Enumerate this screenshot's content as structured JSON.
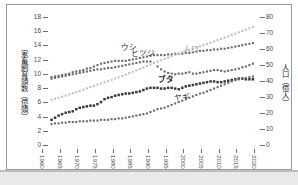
{
  "axes": {
    "left_title": "家畜飼育頭数（億頭）",
    "right_title": "人口（億人）",
    "left_ticks": [
      "0",
      "2",
      "4",
      "6",
      "8",
      "10",
      "12",
      "14",
      "16",
      "18"
    ],
    "right_ticks": [
      "0",
      "10",
      "20",
      "30",
      "40",
      "50",
      "60",
      "70",
      "80"
    ],
    "x_ticks": [
      "1960",
      "1965",
      "1970",
      "1975",
      "1980",
      "1985",
      "1990",
      "1995",
      "2000",
      "2005",
      "2010",
      "2015",
      "2020"
    ]
  },
  "labels": {
    "ushi": "ウシ",
    "hitsuji": "ヒツジ",
    "buta": "ブタ",
    "yagi": "ヤギ",
    "jinko": "人口"
  },
  "chart_data": {
    "type": "line",
    "title": "",
    "xlabel": "",
    "ylabel": "家畜飼育頭数（億頭）",
    "y2label": "人口（億人）",
    "xlim": [
      1960,
      2020
    ],
    "ylim": [
      0,
      18
    ],
    "y2lim": [
      0,
      80
    ],
    "grid": false,
    "legend": "inline-annotations",
    "x": [
      1961,
      1962,
      1963,
      1964,
      1965,
      1966,
      1967,
      1968,
      1969,
      1970,
      1971,
      1972,
      1973,
      1974,
      1975,
      1976,
      1977,
      1978,
      1979,
      1980,
      1981,
      1982,
      1983,
      1984,
      1985,
      1986,
      1987,
      1988,
      1989,
      1990,
      1991,
      1992,
      1993,
      1994,
      1995,
      1996,
      1997,
      1998,
      1999,
      2000,
      2001,
      2002,
      2003,
      2004,
      2005,
      2006,
      2007,
      2008,
      2009,
      2010,
      2011,
      2012,
      2013,
      2014,
      2015,
      2016,
      2017,
      2018
    ],
    "series": [
      {
        "name": "ウシ",
        "axis": "left",
        "color": "#6b6b6b",
        "values": [
          10.1,
          10.2,
          10.3,
          10.4,
          10.5,
          10.6,
          10.8,
          10.9,
          11.0,
          11.1,
          11.3,
          11.4,
          11.6,
          11.8,
          12.0,
          12.1,
          12.2,
          12.3,
          12.4,
          12.4,
          12.4,
          12.4,
          12.5,
          12.6,
          12.7,
          12.8,
          12.9,
          13.0,
          13.1,
          13.2,
          13.2,
          13.2,
          13.2,
          13.3,
          13.3,
          13.4,
          13.4,
          13.4,
          13.5,
          13.5,
          13.6,
          13.7,
          13.8,
          13.8,
          13.9,
          13.9,
          14.0,
          14.0,
          14.1,
          14.1,
          14.2,
          14.3,
          14.4,
          14.5,
          14.6,
          14.7,
          14.8,
          14.9
        ]
      },
      {
        "name": "ヒツジ",
        "axis": "left",
        "color": "#6b6b6b",
        "values": [
          9.9,
          10.0,
          10.1,
          10.2,
          10.3,
          10.4,
          10.5,
          10.6,
          10.7,
          10.8,
          10.9,
          11.0,
          11.1,
          11.2,
          11.2,
          11.3,
          11.4,
          11.4,
          11.5,
          11.6,
          11.7,
          11.8,
          11.9,
          12.0,
          12.1,
          12.2,
          12.3,
          12.3,
          12.3,
          12.1,
          11.6,
          11.2,
          10.9,
          10.7,
          10.6,
          10.5,
          10.6,
          10.6,
          10.7,
          10.8,
          10.6,
          10.6,
          10.7,
          10.8,
          10.9,
          11.0,
          11.1,
          11.1,
          11.0,
          10.9,
          11.0,
          11.1,
          11.2,
          11.3,
          11.5,
          11.6,
          11.8,
          12.0
        ]
      },
      {
        "name": "ブタ",
        "axis": "left",
        "color": "#3a3a3a",
        "values": [
          4.1,
          4.4,
          4.7,
          4.9,
          5.1,
          5.2,
          5.3,
          5.6,
          5.8,
          5.9,
          6.0,
          6.1,
          6.1,
          6.3,
          6.6,
          7.0,
          7.2,
          7.3,
          7.5,
          7.6,
          7.7,
          7.8,
          7.8,
          7.9,
          8.0,
          8.1,
          8.3,
          8.5,
          8.6,
          8.6,
          8.6,
          8.5,
          8.5,
          8.6,
          8.6,
          8.5,
          8.4,
          8.6,
          8.8,
          8.9,
          9.0,
          9.1,
          9.2,
          9.3,
          9.4,
          9.5,
          9.5,
          9.4,
          9.4,
          9.5,
          9.6,
          9.7,
          9.8,
          9.9,
          9.9,
          9.8,
          9.8,
          9.8
        ]
      },
      {
        "name": "ヤギ",
        "axis": "left",
        "color": "#6b6b6b",
        "values": [
          3.5,
          3.6,
          3.6,
          3.7,
          3.7,
          3.8,
          3.8,
          3.8,
          3.9,
          3.9,
          3.9,
          4.0,
          4.0,
          4.0,
          4.1,
          4.1,
          4.1,
          4.2,
          4.2,
          4.3,
          4.3,
          4.4,
          4.5,
          4.6,
          4.7,
          4.8,
          4.9,
          5.0,
          5.2,
          5.4,
          5.6,
          5.7,
          5.8,
          6.0,
          6.2,
          6.4,
          6.6,
          6.8,
          7.0,
          7.2,
          7.4,
          7.6,
          7.8,
          7.9,
          8.1,
          8.3,
          8.5,
          8.7,
          8.9,
          9.1,
          9.3,
          9.5,
          9.7,
          9.8,
          9.9,
          10.0,
          10.1,
          10.2
        ]
      },
      {
        "name": "人口",
        "axis": "right",
        "color": "#c2c2c2",
        "values": [
          30.8,
          31.4,
          32.0,
          32.7,
          33.4,
          34.1,
          34.8,
          35.6,
          36.3,
          37.1,
          37.9,
          38.7,
          39.4,
          40.2,
          40.9,
          41.7,
          42.4,
          43.2,
          44.0,
          44.8,
          45.6,
          46.5,
          47.4,
          48.3,
          49.1,
          50.0,
          50.9,
          51.9,
          52.8,
          53.7,
          54.6,
          55.5,
          56.3,
          57.2,
          58.0,
          58.8,
          59.6,
          60.4,
          61.2,
          61.9,
          62.6,
          63.4,
          64.1,
          64.9,
          65.6,
          66.4,
          67.2,
          68.0,
          68.8,
          69.6,
          70.4,
          71.3,
          72.1,
          72.9,
          73.8,
          74.6,
          75.5,
          76.3
        ]
      }
    ]
  }
}
